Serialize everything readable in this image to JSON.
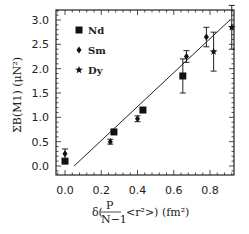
{
  "chart_data": {
    "type": "scatter",
    "title": "",
    "xlabel": "δ( P/(N−1) <r²> ) (fm²)",
    "ylabel": "ΣB(M1) (μN²)",
    "xlim": [
      -0.04,
      0.95
    ],
    "ylim": [
      -0.2,
      3.2
    ],
    "x_ticks": [
      "0.0",
      "0.2",
      "0.4",
      "0.6",
      "0.8"
    ],
    "y_ticks": [
      "0.0",
      "0.5",
      "1.0",
      "1.5",
      "2.0",
      "2.5",
      "3.0"
    ],
    "grid": false,
    "legend_position": "upper left",
    "series": [
      {
        "name": "Nd",
        "marker": "square",
        "points": [
          {
            "x": 0.0,
            "y": 0.1,
            "err": 0.0
          },
          {
            "x": 0.27,
            "y": 0.7,
            "err": 0.0
          },
          {
            "x": 0.43,
            "y": 1.15,
            "err": 0.0
          },
          {
            "x": 0.65,
            "y": 1.85,
            "err": 0.35
          }
        ]
      },
      {
        "name": "Sm",
        "marker": "diamond",
        "points": [
          {
            "x": 0.0,
            "y": 0.25,
            "err": 0.1
          },
          {
            "x": 0.25,
            "y": 0.5,
            "err": 0.05
          },
          {
            "x": 0.4,
            "y": 0.97,
            "err": 0.06
          },
          {
            "x": 0.67,
            "y": 2.25,
            "err": 0.12
          },
          {
            "x": 0.78,
            "y": 2.65,
            "err": 0.2
          }
        ]
      },
      {
        "name": "Dy",
        "marker": "star",
        "points": [
          {
            "x": 0.82,
            "y": 2.35,
            "err": 0.4
          },
          {
            "x": 0.92,
            "y": 2.85,
            "err": 0.45
          }
        ]
      }
    ],
    "fit_line": {
      "x": [
        0.05,
        0.91
      ],
      "y": [
        0.0,
        3.0
      ]
    }
  },
  "legend": {
    "items": [
      {
        "label": "Nd",
        "marker": "square"
      },
      {
        "label": "Sm",
        "marker": "diamond"
      },
      {
        "label": "Dy",
        "marker": "star"
      }
    ]
  },
  "axes": {
    "x_label_prefix": "δ(",
    "x_label_frac_num": "P",
    "x_label_frac_den": "N−1",
    "x_label_suffix": "<r²>)  (fm²)",
    "y_label": "ΣB(M1)  (μN²)"
  }
}
